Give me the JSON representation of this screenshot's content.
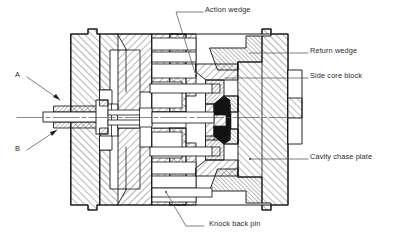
{
  "figure": {
    "type": "engineering-cross-section",
    "background_color": "#ffffff",
    "line_color": "#1a1a1a",
    "text_color": "#2b2b2b"
  },
  "labels": [
    {
      "id": "action-wedge",
      "text": "Action wedge",
      "x": 205,
      "y": 8,
      "leader_from": [
        203,
        12
      ],
      "leader_to": [
        175,
        12
      ],
      "leader_kink": [
        175,
        12
      ],
      "leader_end": [
        196,
        75
      ]
    },
    {
      "id": "return-wedge",
      "text": "Return wedge",
      "x": 310,
      "y": 49,
      "leader_from": [
        308,
        53
      ],
      "leader_to": [
        268,
        53
      ]
    },
    {
      "id": "side-core-block",
      "text": "Side core block",
      "x": 310,
      "y": 74,
      "leader_from": [
        308,
        78
      ],
      "leader_to": [
        216,
        78
      ]
    },
    {
      "id": "cavity-chase-plate",
      "text": "Cavity chase plate",
      "x": 310,
      "y": 155,
      "leader_from": [
        308,
        159
      ],
      "leader_to": [
        247,
        159
      ]
    },
    {
      "id": "knock-back-pin",
      "text": "Knock back pin",
      "x": 208,
      "y": 222,
      "leader_from": [
        205,
        226
      ],
      "leader_to": [
        186,
        226
      ],
      "leader_end": [
        167,
        192
      ]
    },
    {
      "id": "callout-a",
      "text": "A",
      "x": 16,
      "y": 73,
      "leader_from": [
        26,
        78
      ],
      "leader_to": [
        58,
        97
      ]
    },
    {
      "id": "callout-b",
      "text": "B",
      "x": 16,
      "y": 148,
      "leader_from": [
        26,
        150
      ],
      "leader_to": [
        55,
        129
      ]
    }
  ],
  "parts": [
    {
      "name": "Action wedge",
      "note": "hatched wedge driven by the taper, moves the side core"
    },
    {
      "name": "Return wedge",
      "note": "upper right angled wedge that retracts the core"
    },
    {
      "name": "Side core block",
      "note": "hatched block carrying the side core"
    },
    {
      "name": "Cavity chase plate",
      "note": "outer right plate of the mould chase"
    },
    {
      "name": "Knock back pin",
      "note": "lower horizontal pin pushing the core back"
    },
    {
      "name": "A",
      "note": "upper callout on the central core pin assembly"
    },
    {
      "name": "B",
      "note": "lower callout on the central core pin assembly"
    }
  ]
}
